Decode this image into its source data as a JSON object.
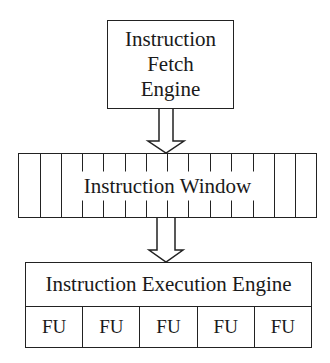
{
  "diagram": {
    "fetch_engine": {
      "lines": [
        "Instruction",
        "Fetch",
        "Engine"
      ]
    },
    "instruction_window": {
      "label": "Instruction Window",
      "slot_count": 14
    },
    "execution_engine": {
      "title": "Instruction Execution Engine",
      "units": [
        "FU",
        "FU",
        "FU",
        "FU",
        "FU"
      ]
    },
    "arrows": [
      {
        "from": "Instruction Fetch Engine",
        "to": "Instruction Window",
        "style": "hollow-block-arrow"
      },
      {
        "from": "Instruction Window",
        "to": "Instruction Execution Engine",
        "style": "hollow-block-arrow"
      }
    ],
    "colors": {
      "stroke": "#222222",
      "fill": "#ffffff",
      "text": "#1a1a1a"
    }
  }
}
